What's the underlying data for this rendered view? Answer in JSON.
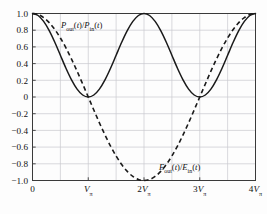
{
  "chart_data": {
    "type": "line",
    "title": "",
    "xlabel": "",
    "ylabel": "",
    "xlim": [
      0,
      4
    ],
    "ylim": [
      -1.0,
      1.0
    ],
    "grid": true,
    "legend_position": "inline-annotation",
    "x_unit": "V_pi",
    "xticks": [
      0,
      1,
      2,
      3,
      4
    ],
    "xticklabels": [
      "0",
      "Vπ",
      "2Vπ",
      "3Vπ",
      "4Vπ"
    ],
    "yticks": [
      1.0,
      0.8,
      0.6,
      0.4,
      0.2,
      0,
      -0.2,
      -0.4,
      -0.6,
      -0.8,
      -1.0
    ],
    "yticklabels": [
      "1.0",
      "0.8",
      "0.6",
      "0.4",
      "0.2",
      "0",
      "−0.2",
      "−0.4",
      "−0.6",
      "−0.8",
      "−1.0"
    ],
    "series": [
      {
        "name": "Pout(t)/Pin(t)",
        "label_html": "P<sub>out</sub>(t)/P<sub>in</sub>(t)",
        "style": "solid",
        "color": "#1a1a1a",
        "formula": "cos^2(pi*x/2)",
        "x": [
          0,
          0.1,
          0.2,
          0.3,
          0.4,
          0.5,
          0.6,
          0.7,
          0.8,
          0.9,
          1.0,
          1.1,
          1.2,
          1.3,
          1.4,
          1.5,
          1.6,
          1.7,
          1.8,
          1.9,
          2.0,
          2.1,
          2.2,
          2.3,
          2.4,
          2.5,
          2.6,
          2.7,
          2.8,
          2.9,
          3.0,
          3.1,
          3.2,
          3.3,
          3.4,
          3.5,
          3.6,
          3.7,
          3.8,
          3.9,
          4.0
        ],
        "values": [
          1.0,
          0.976,
          0.905,
          0.794,
          0.655,
          0.5,
          0.345,
          0.206,
          0.095,
          0.024,
          0.0,
          0.024,
          0.095,
          0.206,
          0.345,
          0.5,
          0.655,
          0.794,
          0.905,
          0.976,
          1.0,
          0.976,
          0.905,
          0.794,
          0.655,
          0.5,
          0.345,
          0.206,
          0.095,
          0.024,
          0.0,
          0.024,
          0.095,
          0.206,
          0.345,
          0.5,
          0.655,
          0.794,
          0.905,
          0.976,
          1.0
        ]
      },
      {
        "name": "Eout(t)/Ein(t)",
        "label_html": "E<sub>out</sub>(t)/E<sub>in</sub>(t)",
        "style": "dashed",
        "color": "#1a1a1a",
        "formula": "cos(pi*x/2)",
        "x": [
          0,
          0.1,
          0.2,
          0.3,
          0.4,
          0.5,
          0.6,
          0.7,
          0.8,
          0.9,
          1.0,
          1.1,
          1.2,
          1.3,
          1.4,
          1.5,
          1.6,
          1.7,
          1.8,
          1.9,
          2.0,
          2.1,
          2.2,
          2.3,
          2.4,
          2.5,
          2.6,
          2.7,
          2.8,
          2.9,
          3.0,
          3.1,
          3.2,
          3.3,
          3.4,
          3.5,
          3.6,
          3.7,
          3.8,
          3.9,
          4.0
        ],
        "values": [
          1.0,
          0.988,
          0.951,
          0.891,
          0.809,
          0.707,
          0.588,
          0.454,
          0.309,
          0.156,
          0.0,
          -0.156,
          -0.309,
          -0.454,
          -0.588,
          -0.707,
          -0.809,
          -0.891,
          -0.951,
          -0.988,
          -1.0,
          -0.988,
          -0.951,
          -0.891,
          -0.809,
          -0.707,
          -0.588,
          -0.454,
          -0.309,
          -0.156,
          0.0,
          0.156,
          0.309,
          0.454,
          0.588,
          0.707,
          0.809,
          0.891,
          0.951,
          0.988,
          1.0
        ]
      }
    ],
    "annotations": [
      {
        "name": "power-ratio-label",
        "text": "Pout(t)/Pin(t)",
        "x": 0.75,
        "y": 0.88
      },
      {
        "name": "field-ratio-label",
        "text": "Eout(t)/Ein(t)",
        "x": 3.0,
        "y": -0.8
      }
    ],
    "colors": {
      "axis": "#3a3a3a",
      "grid": "#c8c8cf",
      "curve": "#1a1a1a",
      "background": "#fdfdfd",
      "text": "#111111"
    }
  }
}
